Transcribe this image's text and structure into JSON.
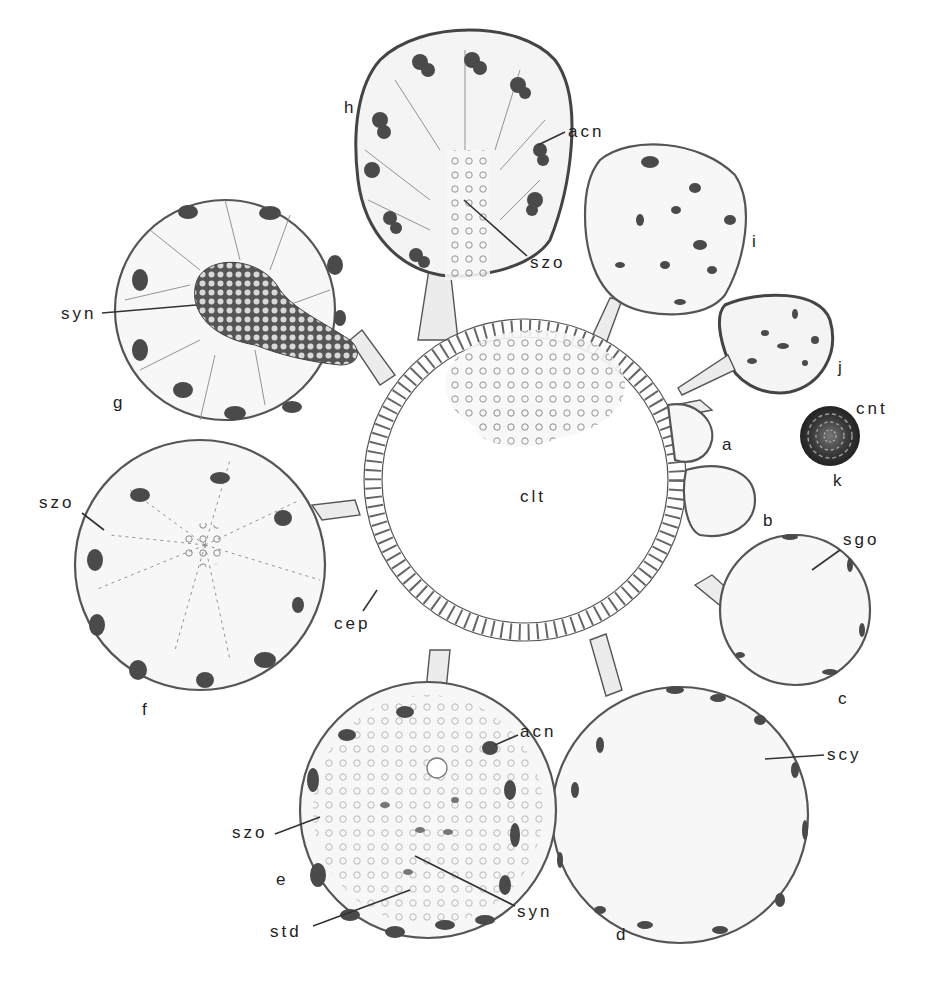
{
  "figure": {
    "center": {
      "label": "clt"
    },
    "lobes": [
      {
        "id": "a",
        "label": "a"
      },
      {
        "id": "b",
        "label": "b"
      },
      {
        "id": "c",
        "label": "c"
      },
      {
        "id": "d",
        "label": "d"
      },
      {
        "id": "e",
        "label": "e"
      },
      {
        "id": "f",
        "label": "f"
      },
      {
        "id": "g",
        "label": "g"
      },
      {
        "id": "h",
        "label": "h"
      },
      {
        "id": "i",
        "label": "i"
      },
      {
        "id": "j",
        "label": "j"
      },
      {
        "id": "k",
        "label": "k"
      }
    ],
    "annotations": {
      "acn_h": "acn",
      "szo_h": "szo",
      "syn_g": "syn",
      "szo_f": "szo",
      "cep": "cep",
      "cnt": "cnt",
      "sgo": "sgo",
      "scy": "scy",
      "acn_e": "acn",
      "szo_e": "szo",
      "std": "std",
      "syn_e": "syn"
    }
  }
}
